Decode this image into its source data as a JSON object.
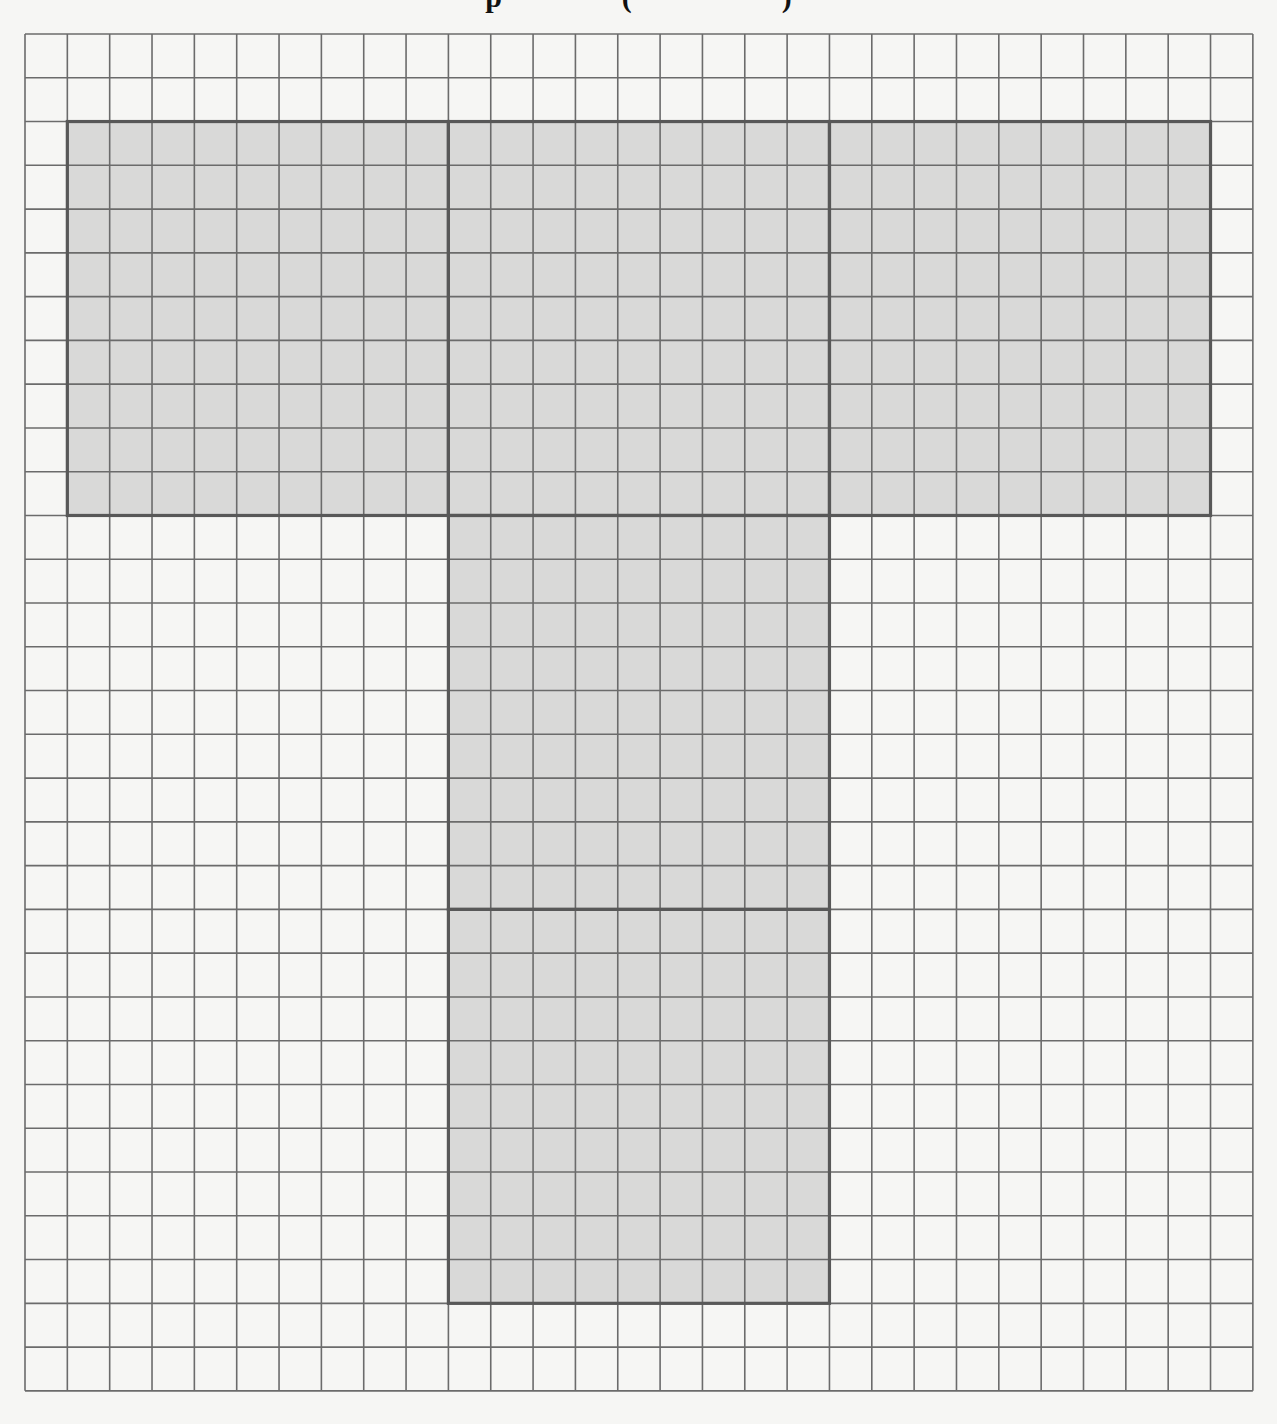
{
  "title": {
    "visible_fragment": "p                (                    )",
    "note_clipped": true
  },
  "grid": {
    "origin_x": 25,
    "origin_y": 34,
    "cols": 29,
    "rows": 31,
    "cell_w": 42.34,
    "cell_h": 43.77,
    "line_color": "#6b6b6b",
    "line_width": 1.6,
    "outline_color": "#585858",
    "outline_width": 3.2,
    "fill_color": "#d9d9d8",
    "background": "#f6f6f4"
  },
  "shape": {
    "name": "T-shaped net of five 9x9 squares",
    "squares": [
      {
        "id": "top-left",
        "col": 1,
        "row": 2,
        "w": 9,
        "h": 9
      },
      {
        "id": "top-center",
        "col": 10,
        "row": 2,
        "w": 9,
        "h": 9
      },
      {
        "id": "top-right",
        "col": 19,
        "row": 2,
        "w": 9,
        "h": 9
      },
      {
        "id": "stem-upper",
        "col": 10,
        "row": 11,
        "w": 9,
        "h": 9
      },
      {
        "id": "stem-lower",
        "col": 10,
        "row": 20,
        "w": 9,
        "h": 9
      }
    ]
  }
}
